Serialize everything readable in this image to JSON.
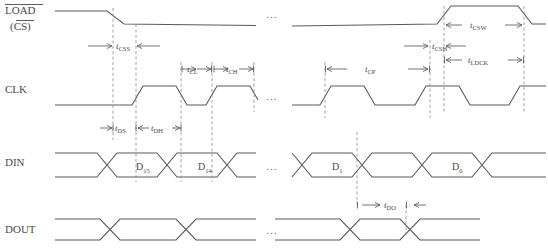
{
  "diagram": {
    "signals": [
      {
        "id": "load",
        "label": "LOAD",
        "label2": "(CS)",
        "overline": true
      },
      {
        "id": "clk",
        "label": "CLK",
        "overline": false
      },
      {
        "id": "din",
        "label": "DIN",
        "overline": false
      },
      {
        "id": "dout",
        "label": "DOUT",
        "overline": false
      }
    ],
    "timing_params": [
      {
        "id": "tcss",
        "base": "t",
        "sub": "CSS"
      },
      {
        "id": "tcl",
        "base": "t",
        "sub": "CL"
      },
      {
        "id": "tch",
        "base": "t",
        "sub": "CH"
      },
      {
        "id": "tds",
        "base": "t",
        "sub": "DS"
      },
      {
        "id": "tdh",
        "base": "t",
        "sub": "DH"
      },
      {
        "id": "tcsw",
        "base": "t",
        "sub": "CSW"
      },
      {
        "id": "tcsh",
        "base": "t",
        "sub": "CSH"
      },
      {
        "id": "tldck",
        "base": "t",
        "sub": "LDCK"
      },
      {
        "id": "tcp",
        "base": "t",
        "sub": "CP"
      },
      {
        "id": "tdo",
        "base": "t",
        "sub": "DO"
      }
    ],
    "data_words": [
      {
        "id": "d15",
        "base": "D",
        "sub": "15"
      },
      {
        "id": "d14",
        "base": "D",
        "sub": "14"
      },
      {
        "id": "d1",
        "base": "D",
        "sub": "1"
      },
      {
        "id": "d0",
        "base": "D",
        "sub": "0"
      }
    ],
    "ellipsis": "…",
    "colors": {
      "wave": "#5a5a5a",
      "dashed_guide": "#8a8a8a",
      "text": "#4a4a4a",
      "background": "#ffffff"
    }
  }
}
